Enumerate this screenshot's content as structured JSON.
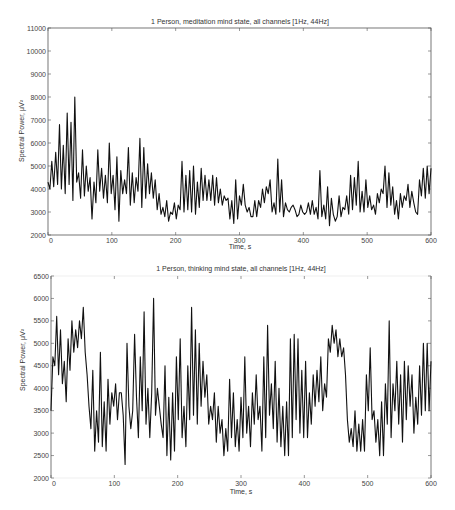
{
  "chart_data": [
    {
      "type": "line",
      "title": "1 Person, meditation mind state, all channels [1Hz, 44Hz]",
      "xlabel": "Time, s",
      "ylabel": "Spectral Power, μV²",
      "xlim": [
        0,
        600
      ],
      "ylim": [
        2000,
        11000
      ],
      "xticks": [
        0,
        100,
        200,
        300,
        400,
        500,
        600
      ],
      "yticks": [
        2000,
        3000,
        4000,
        5000,
        6000,
        7000,
        8000,
        9000,
        10000,
        11000
      ],
      "grid": false,
      "legend": null,
      "series": [
        {
          "name": "meditation",
          "x": [
            0,
            3,
            6,
            9,
            12,
            15,
            18,
            21,
            24,
            27,
            30,
            33,
            36,
            39,
            42,
            45,
            48,
            51,
            54,
            57,
            60,
            63,
            66,
            69,
            72,
            75,
            78,
            81,
            84,
            87,
            90,
            93,
            96,
            99,
            102,
            105,
            108,
            111,
            114,
            117,
            120,
            123,
            126,
            129,
            132,
            135,
            138,
            141,
            144,
            147,
            150,
            153,
            156,
            159,
            162,
            165,
            168,
            171,
            174,
            177,
            180,
            183,
            186,
            189,
            192,
            195,
            198,
            201,
            204,
            207,
            210,
            213,
            216,
            219,
            222,
            225,
            228,
            231,
            234,
            237,
            240,
            243,
            246,
            249,
            252,
            255,
            258,
            261,
            264,
            267,
            270,
            273,
            276,
            279,
            282,
            285,
            288,
            291,
            294,
            297,
            300,
            303,
            306,
            309,
            312,
            315,
            318,
            321,
            324,
            327,
            330,
            333,
            336,
            339,
            342,
            345,
            348,
            351,
            354,
            357,
            360,
            363,
            366,
            369,
            372,
            375,
            378,
            381,
            384,
            387,
            390,
            393,
            396,
            399,
            402,
            405,
            408,
            411,
            414,
            417,
            420,
            423,
            426,
            429,
            432,
            435,
            438,
            441,
            444,
            447,
            450,
            453,
            456,
            459,
            462,
            465,
            468,
            471,
            474,
            477,
            480,
            483,
            486,
            489,
            492,
            495,
            498,
            501,
            504,
            507,
            510,
            513,
            516,
            519,
            522,
            525,
            528,
            531,
            534,
            537,
            540,
            543,
            546,
            549,
            552,
            555,
            558,
            561,
            564,
            567,
            570,
            573,
            576,
            579,
            582,
            585,
            588,
            591,
            594,
            597,
            600
          ],
          "values": [
            4300,
            4000,
            5200,
            4100,
            5600,
            4200,
            6800,
            4000,
            5900,
            3800,
            7300,
            4200,
            6900,
            3500,
            8000,
            4300,
            4700,
            3600,
            5700,
            3700,
            5000,
            3900,
            4500,
            2700,
            4300,
            3400,
            5700,
            3900,
            4900,
            3600,
            4600,
            3400,
            6000,
            3800,
            4600,
            3100,
            5400,
            2600,
            4800,
            3800,
            4400,
            3800,
            5800,
            3300,
            4700,
            3400,
            4500,
            3900,
            6200,
            3200,
            5800,
            3600,
            5100,
            3800,
            4700,
            3600,
            4400,
            3100,
            3800,
            2900,
            3200,
            2800,
            3500,
            2600,
            3000,
            2900,
            3400,
            2700,
            3300,
            3100,
            5200,
            3000,
            4600,
            3100,
            4800,
            3000,
            5000,
            2900,
            4300,
            3200,
            4900,
            3500,
            4600,
            3500,
            4400,
            3500,
            4600,
            3300,
            4500,
            3400,
            4000,
            3300,
            3700,
            3500,
            3600,
            2700,
            3500,
            2500,
            4400,
            2700,
            3700,
            3300,
            4200,
            3300,
            3000,
            3200,
            2800,
            2800,
            3500,
            2800,
            3500,
            3200,
            4000,
            3400,
            4100,
            3800,
            4400,
            3000,
            3400,
            2900,
            5300,
            3000,
            4400,
            2800,
            3400,
            3100,
            3000,
            3200,
            3300,
            3100,
            2800,
            2900,
            3300,
            3000,
            2900,
            3000,
            3400,
            2900,
            3500,
            2900,
            3200,
            2700,
            4800,
            2800,
            3300,
            2700,
            4100,
            2400,
            3600,
            2900,
            2600,
            2800,
            3700,
            2800,
            3200,
            3100,
            3700,
            2900,
            4600,
            3100,
            4500,
            3300,
            5200,
            3000,
            3900,
            3000,
            4400,
            3200,
            3700,
            3100,
            3300,
            2900,
            3800,
            3400,
            4000,
            3800,
            5000,
            3200,
            4700,
            3300,
            4100,
            2900,
            3500,
            2700,
            3800,
            3200,
            3700,
            3500,
            4200,
            3200,
            3900,
            3400,
            3000,
            2900,
            4400,
            3700,
            4900,
            3600,
            5000,
            3800,
            4900,
            3700,
            3700,
            3900,
            10600,
            2900,
            3400,
            2700,
            3100,
            2700,
            2800,
            3400,
            3800,
            3500,
            4600,
            3000,
            3800,
            3700,
            5200,
            3600,
            4900,
            3000,
            3600,
            3400,
            4300,
            2900,
            6700
          ]
        }
      ]
    },
    {
      "type": "line",
      "title": "1 Person, thinking mind state, all channels [1Hz, 44Hz]",
      "xlabel": "Time, s",
      "ylabel": "Spectral Power, μV²",
      "xlim": [
        0,
        600
      ],
      "ylim": [
        2000,
        6500
      ],
      "xticks": [
        0,
        100,
        200,
        300,
        400,
        500,
        600
      ],
      "yticks": [
        2000,
        2500,
        3000,
        3500,
        4000,
        4500,
        5000,
        5500,
        6000,
        6500
      ],
      "grid": false,
      "legend": null,
      "series": [
        {
          "name": "thinking",
          "x": [
            0,
            3,
            6,
            9,
            12,
            15,
            18,
            21,
            24,
            27,
            30,
            33,
            36,
            39,
            42,
            45,
            48,
            51,
            54,
            57,
            60,
            63,
            66,
            69,
            72,
            75,
            78,
            81,
            84,
            87,
            90,
            93,
            96,
            99,
            102,
            105,
            108,
            111,
            114,
            117,
            120,
            123,
            126,
            129,
            132,
            135,
            138,
            141,
            144,
            147,
            150,
            153,
            156,
            159,
            162,
            165,
            168,
            171,
            174,
            177,
            180,
            183,
            186,
            189,
            192,
            195,
            198,
            201,
            204,
            207,
            210,
            213,
            216,
            219,
            222,
            225,
            228,
            231,
            234,
            237,
            240,
            243,
            246,
            249,
            252,
            255,
            258,
            261,
            264,
            267,
            270,
            273,
            276,
            279,
            282,
            285,
            288,
            291,
            294,
            297,
            300,
            303,
            306,
            309,
            312,
            315,
            318,
            321,
            324,
            327,
            330,
            333,
            336,
            339,
            342,
            345,
            348,
            351,
            354,
            357,
            360,
            363,
            366,
            369,
            372,
            375,
            378,
            381,
            384,
            387,
            390,
            393,
            396,
            399,
            402,
            405,
            408,
            411,
            414,
            417,
            420,
            423,
            426,
            429,
            432,
            435,
            438,
            441,
            444,
            447,
            450,
            453,
            456,
            459,
            462,
            465,
            468,
            471,
            474,
            477,
            480,
            483,
            486,
            489,
            492,
            495,
            498,
            501,
            504,
            507,
            510,
            513,
            516,
            519,
            522,
            525,
            528,
            531,
            534,
            537,
            540,
            543,
            546,
            549,
            552,
            555,
            558,
            561,
            564,
            567,
            570,
            573,
            576,
            579,
            582,
            585,
            588,
            591,
            594,
            597,
            600
          ],
          "values": [
            3500,
            4700,
            4500,
            5600,
            4300,
            5300,
            4100,
            4600,
            3700,
            5100,
            4400,
            5500,
            4800,
            5300,
            4900,
            5500,
            5100,
            5800,
            4800,
            4300,
            3600,
            3100,
            4400,
            2600,
            3500,
            2800,
            4800,
            2700,
            3700,
            2600,
            4200,
            3200,
            3900,
            3600,
            4100,
            3300,
            3900,
            3900,
            3400,
            2300,
            5000,
            3600,
            3100,
            3500,
            5200,
            3800,
            2900,
            4700,
            3500,
            5700,
            3200,
            4000,
            2900,
            3900,
            6000,
            3400,
            4000,
            3600,
            3200,
            2900,
            4500,
            2500,
            3800,
            2400,
            3900,
            2600,
            4700,
            3300,
            5100,
            2900,
            3600,
            2700,
            4500,
            3300,
            5800,
            3400,
            5300,
            3200,
            5000,
            3600,
            4600,
            3800,
            4300,
            3200,
            3600,
            3300,
            3900,
            2800,
            3600,
            3000,
            3300,
            2500,
            3100,
            2600,
            4200,
            2900,
            3900,
            2700,
            3300,
            2600,
            3800,
            2900,
            4700,
            3000,
            3600,
            2700,
            3900,
            3200,
            4300,
            3300,
            3600,
            2600,
            4700,
            2900,
            5400,
            3400,
            4100,
            3100,
            4600,
            2800,
            4000,
            2700,
            3600,
            2500,
            3700,
            2500,
            5100,
            2900,
            5200,
            3300,
            5100,
            3000,
            4400,
            2900,
            4600,
            2900,
            3900,
            3200,
            4300,
            3600,
            4400,
            3700,
            4700,
            3500,
            4100,
            3800,
            5100,
            4800,
            5400,
            5000,
            5300,
            4700,
            5100,
            4700,
            4900,
            4300,
            3300,
            2800,
            3100,
            2700,
            3500,
            2600,
            3200,
            2600,
            3300,
            2600,
            4300,
            3500,
            4900,
            3300,
            3500,
            2800,
            3300,
            2500,
            3700,
            2500,
            4100,
            3200,
            5500,
            2900,
            4100,
            3500,
            4600,
            3200,
            4300,
            2800,
            4600,
            3300,
            4500,
            3600,
            4300,
            3000,
            3800,
            3200,
            4500,
            3400,
            5000,
            3500,
            5000,
            3500,
            4600,
            3000,
            4500,
            3200,
            3500,
            3000,
            3900,
            3100,
            3600,
            3000,
            4000
          ]
        }
      ]
    }
  ],
  "panels": [
    {
      "title": "1 Person, meditation mind state, all channels [1Hz, 44Hz]",
      "xlabel": "Time, s",
      "ylabel": "Spectral Power, μV²"
    },
    {
      "title": "1 Person, thinking mind state, all channels [1Hz, 44Hz]",
      "xlabel": "Time, s",
      "ylabel": "Spectral Power, μV²"
    }
  ],
  "style": {
    "line_color": "#111111",
    "axis_color": "#555555",
    "tick_text_color": "#444444"
  }
}
